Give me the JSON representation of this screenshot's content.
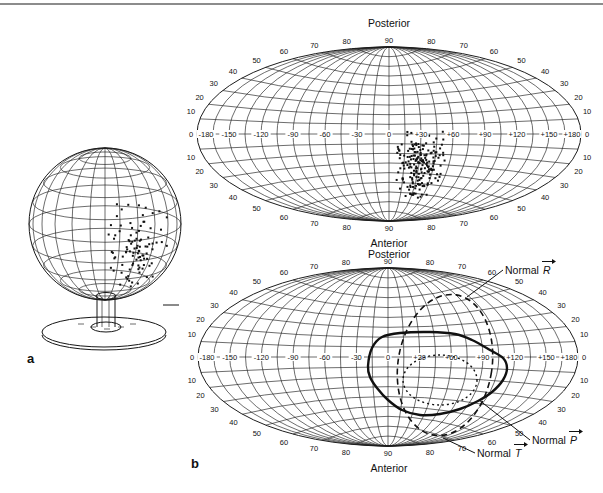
{
  "page": {
    "background": "#ffffff",
    "top_rule_color": "#8c8c8c"
  },
  "panels": {
    "a_label": "a",
    "b_label": "b"
  },
  "globe": {
    "scatter": {
      "count": 115,
      "center_x": 136,
      "center_y": 252,
      "sd_x": 13,
      "sd_y": 25,
      "seed": 11
    }
  },
  "map_top": {
    "title_top": "Posterior",
    "title_bottom": "Anterior",
    "pole_label": "90",
    "edge_label": "0",
    "latitude_rim_labels": [
      10,
      20,
      30,
      40,
      50,
      60,
      70,
      80
    ],
    "longitude_labels": [
      "-180",
      "-150",
      "-120",
      "-90",
      "-60",
      "-30",
      "0",
      "+30",
      "+60",
      "+90",
      "+120",
      "+150",
      "+180"
    ],
    "scatter": {
      "count": 195,
      "lon_mean": 33,
      "lon_sd": 11,
      "lat_mean": -30,
      "lat_sd": 14,
      "lon_min": 0,
      "lon_max": 76,
      "lat_min": -62,
      "lat_max": 2,
      "seed": 7
    }
  },
  "map_bottom": {
    "title_top": "Posterior",
    "title_bottom": "Anterior",
    "pole_label": "90",
    "edge_label": "0",
    "latitude_rim_labels": [
      10,
      20,
      30,
      40,
      50,
      60,
      70,
      80
    ],
    "longitude_labels": [
      "-180",
      "-150",
      "-120",
      "-90",
      "-60",
      "-30",
      "0",
      "+30",
      "+60",
      "+90",
      "+120",
      "+150",
      "+180"
    ],
    "loops": {
      "solid_outline_offsets": [
        [
          -20,
          9
        ],
        [
          -16,
          -9
        ],
        [
          -6,
          -20
        ],
        [
          12,
          -24
        ],
        [
          42,
          -25
        ],
        [
          67,
          -23
        ],
        [
          84,
          -17
        ],
        [
          102,
          -7
        ],
        [
          115,
          1
        ],
        [
          119,
          11
        ],
        [
          115,
          23
        ],
        [
          104,
          35
        ],
        [
          90,
          44
        ],
        [
          72,
          52
        ],
        [
          52,
          57
        ],
        [
          32,
          58
        ],
        [
          14,
          53
        ],
        [
          0,
          43
        ],
        [
          -11,
          31
        ],
        [
          -18,
          20
        ]
      ],
      "dashed_ellipse": {
        "cx_offset": 57,
        "cy_offset": 8,
        "rx": 47,
        "ry": 71,
        "rotation_deg": 9
      },
      "dotted_ellipse": {
        "cx_offset": 52,
        "cy_offset": 23,
        "rx": 37,
        "ry": 25
      }
    },
    "annotations": [
      {
        "text": "Normal",
        "vector_letter": "R",
        "label_x": 505,
        "label_y": 274,
        "target_x": 467,
        "target_y": 297
      },
      {
        "text": "Normal",
        "vector_letter": "P",
        "label_x": 532,
        "label_y": 444,
        "target_x": 479,
        "target_y": 400
      },
      {
        "text": "Normal",
        "vector_letter": "T",
        "label_x": 477,
        "label_y": 457,
        "target_x": 443,
        "target_y": 438
      }
    ]
  }
}
